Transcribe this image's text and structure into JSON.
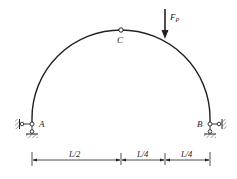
{
  "diagram": {
    "type": "three-hinged semicircular arch",
    "colors": {
      "line": "#222222",
      "background": "#ffffff"
    },
    "nodes": {
      "A": {
        "label": "A",
        "support": "pin with horizontal link (left)"
      },
      "B": {
        "label": "B",
        "support": "pin with horizontal link (right)"
      },
      "C": {
        "label": "C",
        "type": "hinge at crown"
      }
    },
    "load": {
      "label": "F",
      "subscript": "P",
      "direction": "down"
    },
    "dimensions": [
      {
        "label": "L/2"
      },
      {
        "label": "L/4"
      },
      {
        "label": "L/4"
      }
    ]
  }
}
